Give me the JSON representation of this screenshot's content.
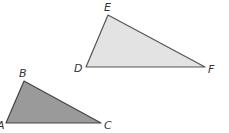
{
  "diagram": {
    "type": "similar-triangles",
    "triangles": [
      {
        "name": "DEF",
        "fill": "#e3e3e3",
        "stroke": "#555555",
        "vertices": {
          "D": {
            "label": "D",
            "x": 86,
            "y": 67
          },
          "E": {
            "label": "E",
            "x": 108,
            "y": 15
          },
          "F": {
            "label": "F",
            "x": 205,
            "y": 67
          }
        }
      },
      {
        "name": "ABC",
        "fill": "#9a9a9a",
        "stroke": "#444444",
        "vertices": {
          "A": {
            "label": "A",
            "x": 6,
            "y": 123
          },
          "B": {
            "label": "B",
            "x": 24,
            "y": 81
          },
          "C": {
            "label": "C",
            "x": 101,
            "y": 123
          }
        }
      }
    ]
  }
}
